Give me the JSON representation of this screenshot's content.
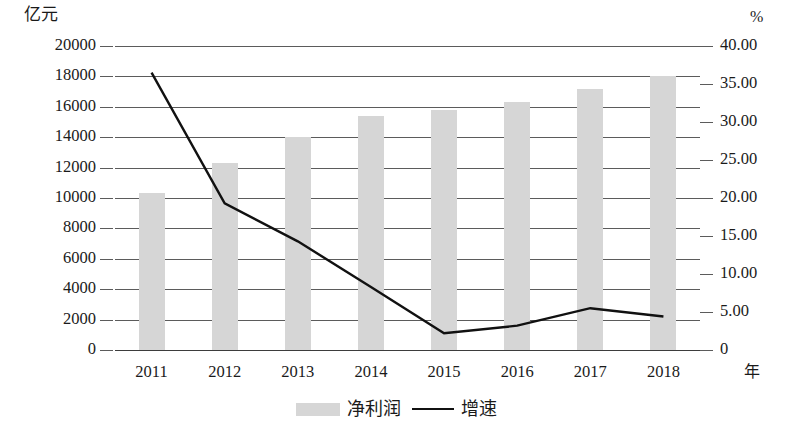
{
  "chart_data": {
    "type": "bar",
    "title": "",
    "subtitle": "",
    "xlabel": "年",
    "ylabel": "亿元",
    "y2label": "%",
    "categories": [
      "2011",
      "2012",
      "2013",
      "2014",
      "2015",
      "2016",
      "2017",
      "2018"
    ],
    "series": [
      {
        "name": "净利润",
        "type": "bar",
        "axis": "left",
        "unit": "亿元",
        "color": "#d6d6d6",
        "values": [
          10300,
          12300,
          14000,
          15400,
          15800,
          16300,
          17200,
          18000
        ]
      },
      {
        "name": "增速",
        "type": "line",
        "axis": "right",
        "unit": "%",
        "color": "#111111",
        "values": [
          36.5,
          19.3,
          14.3,
          8.3,
          2.2,
          3.2,
          5.5,
          4.4
        ]
      }
    ],
    "ylim": [
      0,
      20000
    ],
    "y2lim": [
      0,
      40
    ],
    "yticks": [
      "0",
      "2000",
      "4000",
      "6000",
      "8000",
      "10000",
      "12000",
      "14000",
      "16000",
      "18000",
      "20000"
    ],
    "ytick_values": [
      0,
      2000,
      4000,
      6000,
      8000,
      10000,
      12000,
      14000,
      16000,
      18000,
      20000
    ],
    "y2ticks": [
      "0",
      "5.00",
      "10.00",
      "15.00",
      "20.00",
      "25.00",
      "30.00",
      "35.00",
      "40.00"
    ],
    "y2tick_values": [
      0,
      5,
      10,
      15,
      20,
      25,
      30,
      35,
      40
    ],
    "grid": true,
    "grid_axis": "y",
    "legend_position": "bottom"
  },
  "legend": {
    "items": [
      {
        "label": "净利润",
        "marker": "bar-swatch"
      },
      {
        "label": "增速",
        "marker": "line-swatch"
      }
    ]
  },
  "axis_captions": {
    "left_unit": "亿元",
    "right_unit": "%",
    "x_unit": "年"
  },
  "colors": {
    "bar_fill": "#d6d6d6",
    "line_stroke": "#111111",
    "gridline": "#5b5b5b",
    "text": "#1a1a1a",
    "background": "#ffffff"
  }
}
